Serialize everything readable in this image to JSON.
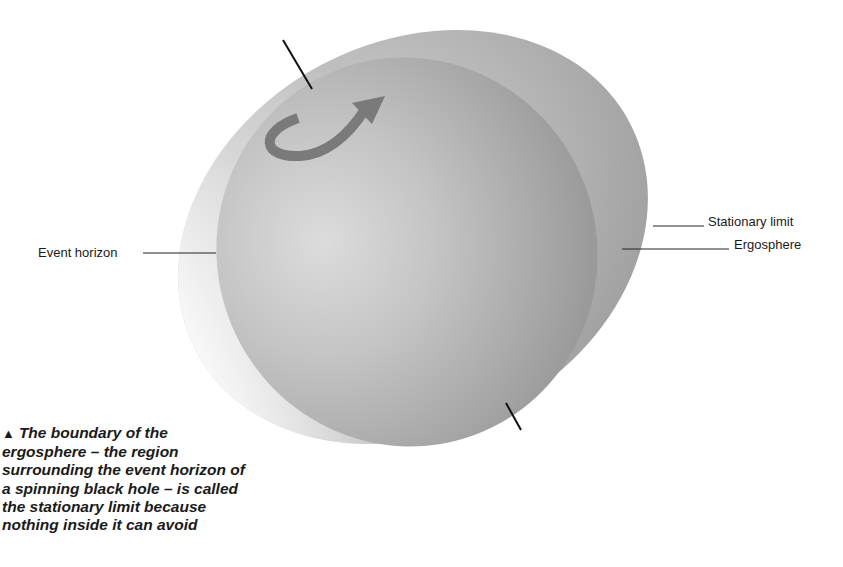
{
  "diagram": {
    "labels": {
      "event_horizon": "Event horizon",
      "stationary_limit": "Stationary limit",
      "ergosphere": "Ergosphere"
    },
    "caption": {
      "marker": "▲",
      "text": "The boundary of the ergosphere – the region surrounding the event horizon of a spinning black hole – is called the stationary limit because nothing inside it can avoid"
    },
    "icons": {
      "rotation_arrow": "curved-arrow",
      "axis": "rotation-axis-line"
    },
    "colors": {
      "background": "#ffffff",
      "ergosphere_light": "#e8e8e8",
      "ergosphere_dark": "#9c9c9c",
      "horizon_light": "#d6d6d6",
      "horizon_dark": "#8a8a8a",
      "arrow": "#7a7a7a",
      "text": "#1a1a1a"
    }
  }
}
